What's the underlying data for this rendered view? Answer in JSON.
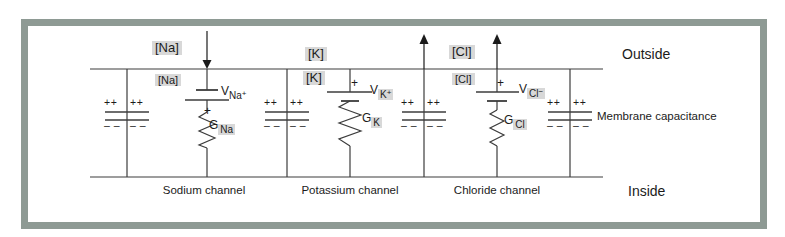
{
  "colors": {
    "frame": "#8e9a94",
    "highlight": "#d8d8d8",
    "wire": "#3c3c3c"
  },
  "regions": {
    "outside": "Outside",
    "inside": "Inside",
    "membrane_capacitance": "Membrane capacitance"
  },
  "marks": {
    "plus": "++",
    "minus": "– –"
  },
  "channels": [
    {
      "id": "sodium",
      "name": "Sodium channel",
      "conc_out": "[Na]",
      "conc_in": "[Na]",
      "v_symbol": "V",
      "ion": "Na",
      "charge": "+",
      "polarity": "+",
      "g_symbol": "G",
      "flow": "inward"
    },
    {
      "id": "potassium",
      "name": "Potassium channel",
      "conc_out": "[K]",
      "conc_in": "[K]",
      "v_symbol": "V",
      "ion": "K",
      "charge": "+",
      "polarity": "+",
      "g_symbol": "G",
      "flow": "outward"
    },
    {
      "id": "chloride",
      "name": "Chloride channel",
      "conc_out": "[Cl]",
      "conc_in": "[Cl]",
      "v_symbol": "V",
      "ion": "Cl",
      "charge": "−",
      "polarity": "+",
      "g_symbol": "G",
      "flow": "outward"
    }
  ]
}
